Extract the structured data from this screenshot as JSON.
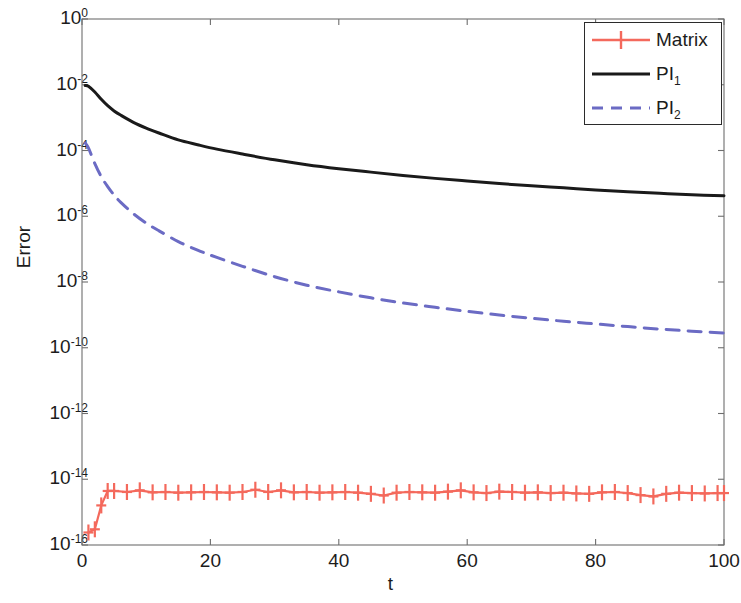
{
  "chart_data": {
    "type": "line",
    "title": "",
    "xlabel": "t",
    "ylabel": "Error",
    "xlim": [
      0,
      100
    ],
    "ylim": [
      1e-16,
      1
    ],
    "yscale": "log",
    "xscale": "linear",
    "grid": false,
    "legend_position": "top-right",
    "xticks": [
      0,
      20,
      40,
      60,
      80,
      100
    ],
    "xtick_labels": [
      "0",
      "20",
      "40",
      "60",
      "80",
      "100"
    ],
    "yticks": [
      1.0,
      0.01,
      0.0001,
      1e-06,
      1e-08,
      1e-10,
      1e-12,
      1e-14,
      1e-16
    ],
    "ytick_labels": [
      "10^0",
      "10^-2",
      "10^-4",
      "10^-6",
      "10^-8",
      "10^-10",
      "10^-12",
      "10^-14",
      "10^-16"
    ],
    "ytick_mantissa": [
      "10",
      "10",
      "10",
      "10",
      "10",
      "10",
      "10",
      "10",
      "10"
    ],
    "ytick_exponent": [
      "0",
      "-2",
      "-4",
      "-6",
      "-8",
      "-10",
      "-12",
      "-14",
      "-16"
    ],
    "series": [
      {
        "name": "Matrix",
        "color": "#F4695C",
        "style": "solid-plus",
        "linewidth": 2.2,
        "marker": "plus",
        "x": [
          1,
          2,
          3,
          4,
          5,
          7,
          9,
          11,
          13,
          15,
          17,
          19,
          21,
          23,
          25,
          27,
          29,
          31,
          33,
          35,
          37,
          39,
          41,
          43,
          45,
          47,
          49,
          51,
          53,
          55,
          57,
          59,
          61,
          63,
          65,
          67,
          69,
          71,
          73,
          75,
          77,
          79,
          81,
          83,
          85,
          87,
          89,
          91,
          93,
          95,
          97,
          99,
          100
        ],
        "y": [
          2.4e-16,
          3e-16,
          1.6e-15,
          4.4e-15,
          4.4e-15,
          4.1e-15,
          4.6e-15,
          4e-15,
          4.1e-15,
          3.9e-15,
          4e-15,
          4.1e-15,
          4e-15,
          3.9e-15,
          4.1e-15,
          4.8e-15,
          4.1e-15,
          4.6e-15,
          4e-15,
          4.1e-15,
          3.9e-15,
          4e-15,
          4.1e-15,
          3.9e-15,
          3.6e-15,
          3.2e-15,
          3.9e-15,
          4.1e-15,
          4e-15,
          3.9e-15,
          4.2e-15,
          4.6e-15,
          4e-15,
          3.8e-15,
          4.2e-15,
          4.1e-15,
          3.9e-15,
          4e-15,
          3.8e-15,
          3.9e-15,
          3.7e-15,
          3.6e-15,
          4e-15,
          4.1e-15,
          3.8e-15,
          3.3e-15,
          3e-15,
          3.6e-15,
          3.9e-15,
          3.8e-15,
          3.7e-15,
          3.8e-15,
          3.8e-15
        ]
      },
      {
        "name": "PI_1",
        "label_base": "PI",
        "label_sub": "1",
        "color": "#1a1a1a",
        "style": "solid",
        "linewidth": 3.0,
        "marker": "none",
        "x": [
          0.5,
          1,
          2,
          3,
          4,
          5,
          6,
          8,
          10,
          12,
          15,
          18,
          21,
          25,
          30,
          35,
          40,
          45,
          50,
          55,
          60,
          65,
          70,
          75,
          80,
          85,
          90,
          95,
          100
        ],
        "y": [
          0.0095,
          0.009,
          0.006,
          0.0036,
          0.0023,
          0.0016,
          0.0012,
          0.00072,
          0.00048,
          0.00034,
          0.00021,
          0.00015,
          0.00011,
          7.8e-05,
          5.2e-05,
          3.7e-05,
          2.8e-05,
          2.2e-05,
          1.75e-05,
          1.42e-05,
          1.18e-05,
          9.9e-06,
          8.4e-06,
          7.3e-06,
          6.3e-06,
          5.6e-06,
          5e-06,
          4.5e-06,
          4.2e-06
        ]
      },
      {
        "name": "PI_2",
        "label_base": "PI",
        "label_sub": "2",
        "color": "#6B6BC4",
        "style": "dashed",
        "linewidth": 3.0,
        "marker": "none",
        "dash": "13,9",
        "x": [
          0.5,
          1,
          2,
          3,
          4,
          5,
          6,
          8,
          10,
          12,
          15,
          18,
          21,
          25,
          30,
          35,
          40,
          45,
          50,
          55,
          60,
          65,
          70,
          75,
          80,
          85,
          90,
          95,
          100
        ],
        "y": [
          0.00017,
          0.00012,
          4e-05,
          1.6e-05,
          8e-06,
          4.4e-06,
          2.7e-06,
          1.2e-06,
          6.2e-07,
          3.6e-07,
          1.7e-07,
          9.3e-08,
          5.6e-08,
          3e-08,
          1.45e-08,
          8e-09,
          5e-09,
          3.3e-09,
          2.3e-09,
          1.7e-09,
          1.28e-09,
          9.9e-10,
          7.9e-10,
          6.4e-10,
          5.3e-10,
          4.4e-10,
          3.7e-10,
          3.2e-10,
          2.8e-10
        ]
      }
    ]
  },
  "axes": {
    "frame_color": "#6e6e6e",
    "background": "#ffffff"
  },
  "legend": {
    "entries": [
      {
        "label": "Matrix",
        "sub": ""
      },
      {
        "label": "PI",
        "sub": "1"
      },
      {
        "label": "PI",
        "sub": "2"
      }
    ]
  }
}
